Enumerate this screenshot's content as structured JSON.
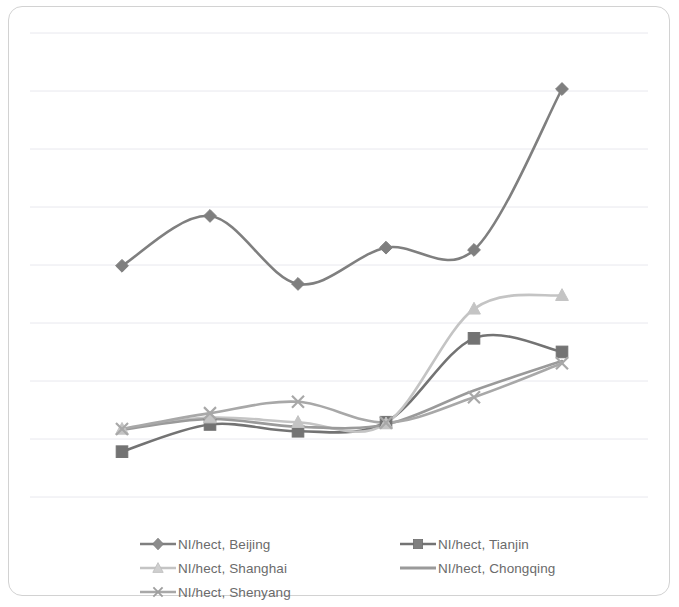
{
  "chart_data": {
    "type": "line",
    "title": "",
    "subtitle": "",
    "xlabel": "",
    "ylabel": "",
    "grid": true,
    "gridline_count": 9,
    "legend_position": "bottom",
    "x_tick_labels": [],
    "y_tick_labels": [],
    "axis_labels_visible": false,
    "x": [
      1,
      2,
      3,
      4,
      5,
      6
    ],
    "categories": [
      "1",
      "2",
      "3",
      "4",
      "5",
      "6"
    ],
    "ylim": [
      0,
      9
    ],
    "series": [
      {
        "name": "NI/hect, Beijing",
        "marker": "diamond",
        "color": "#7f7f7f",
        "values": [
          5.1,
          6.2,
          4.7,
          5.5,
          5.45,
          9.0
        ]
      },
      {
        "name": "NI/hect, Tianjin",
        "marker": "square",
        "color": "#737373",
        "values": [
          1.0,
          1.6,
          1.45,
          1.65,
          3.5,
          3.2
        ]
      },
      {
        "name": "NI/hect, Shanghai",
        "marker": "triangle",
        "color": "#c4c4c4",
        "values": [
          1.5,
          1.75,
          1.65,
          1.62,
          4.15,
          4.45
        ]
      },
      {
        "name": "NI/hect, Chongqing",
        "marker": "none",
        "color": "#9a9a9a",
        "values": [
          1.48,
          1.72,
          1.55,
          1.6,
          2.35,
          3.0
        ]
      },
      {
        "name": "NI/hect, Shenyang",
        "marker": "cross",
        "color": "#a8a8a8",
        "values": [
          1.5,
          1.85,
          2.1,
          1.64,
          2.2,
          2.95
        ]
      }
    ]
  },
  "legend": {
    "left_column": [
      {
        "label": "NI/hect, Beijing",
        "marker": "diamond",
        "color": "#7f7f7f"
      },
      {
        "label": "NI/hect, Shanghai",
        "marker": "triangle",
        "color": "#c4c4c4"
      },
      {
        "label": "NI/hect, Shenyang",
        "marker": "cross",
        "color": "#a8a8a8"
      }
    ],
    "right_column": [
      {
        "label": "NI/hect, Tianjin",
        "marker": "square",
        "color": "#737373"
      },
      {
        "label": "NI/hect, Chongqing",
        "marker": "none",
        "color": "#9a9a9a"
      }
    ]
  },
  "colors": {
    "border": "#d2d2d2",
    "gridline": "#e8e8ee",
    "background": "#ffffff",
    "legend_text": "#6b6b6b"
  }
}
